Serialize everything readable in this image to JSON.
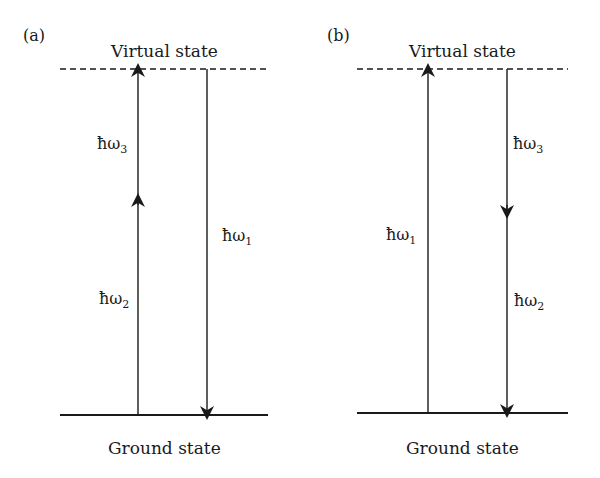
{
  "panels": [
    {
      "id": "a",
      "label": "(a)",
      "top_level": "Virtual state",
      "bottom_level": "Ground state",
      "transitions": [
        {
          "symbol": "ħω",
          "subscript": "3",
          "direction": "up",
          "segment": "upper"
        },
        {
          "symbol": "ħω",
          "subscript": "2",
          "direction": "up",
          "segment": "lower"
        },
        {
          "symbol": "ħω",
          "subscript": "1",
          "direction": "down",
          "segment": "full"
        }
      ]
    },
    {
      "id": "b",
      "label": "(b)",
      "top_level": "Virtual state",
      "bottom_level": "Ground state",
      "transitions": [
        {
          "symbol": "ħω",
          "subscript": "1",
          "direction": "up",
          "segment": "full"
        },
        {
          "symbol": "ħω",
          "subscript": "3",
          "direction": "down",
          "segment": "upper"
        },
        {
          "symbol": "ħω",
          "subscript": "2",
          "direction": "down",
          "segment": "lower"
        }
      ]
    }
  ],
  "colors": {
    "line": "#1a1a1a",
    "background": "#ffffff"
  }
}
